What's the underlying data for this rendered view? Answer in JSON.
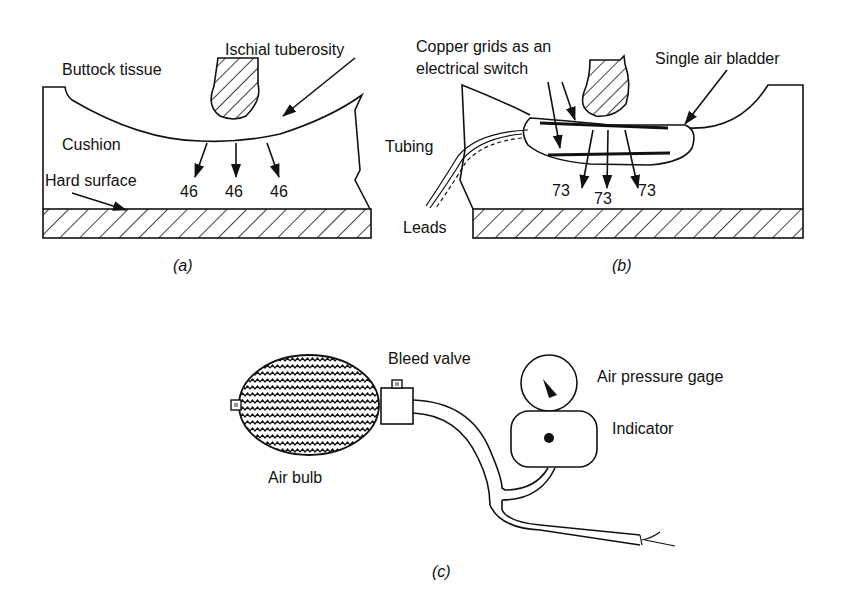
{
  "panel_a": {
    "caption": "(a)",
    "labels": {
      "ischial_tuberosity": "Ischial tuberosity",
      "buttock_tissue": "Buttock tissue",
      "cushion": "Cushion",
      "hard_surface": "Hard surface"
    },
    "pressures": [
      "46",
      "46",
      "46"
    ]
  },
  "panel_b": {
    "caption": "(b)",
    "labels": {
      "copper_grids_line1": "Copper grids as an",
      "copper_grids_line2": "electrical switch",
      "single_air_bladder": "Single air bladder",
      "tubing": "Tubing",
      "leads": "Leads"
    },
    "pressures": [
      "73",
      "73",
      "73"
    ]
  },
  "panel_c": {
    "caption": "(c)",
    "labels": {
      "bleed_valve": "Bleed valve",
      "air_pressure_gage": "Air pressure gage",
      "indicator": "Indicator",
      "air_bulb": "Air bulb"
    }
  }
}
